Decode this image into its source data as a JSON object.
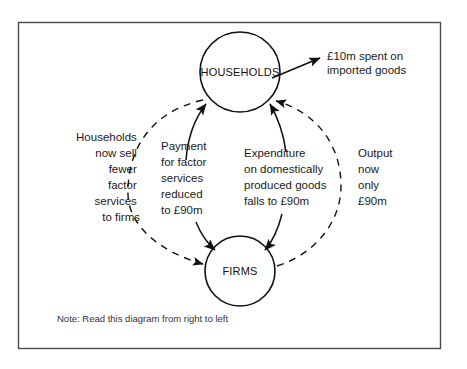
{
  "diagram": {
    "nodes": [
      {
        "id": "households",
        "label": "HOUSEHOLDS",
        "cx": 240,
        "cy": 72,
        "r": 40
      },
      {
        "id": "firms",
        "label": "FIRMS",
        "cx": 240,
        "cy": 271,
        "r": 35
      }
    ],
    "annotations": {
      "imports": "£10m spent on imported goods",
      "households_sell": "Households\nnow sell\nfewer\nfactor\nservices\nto firms",
      "households_sell_lines": [
        "Households",
        "now sell",
        "fewer",
        "factor",
        "services",
        "to firms"
      ],
      "payment": "Payment\nfor factor\nservices\nreduced\nto £90m",
      "payment_lines": [
        "Payment",
        "for factor",
        "services",
        "reduced",
        "to £90m"
      ],
      "expenditure": "Expenditure\non domestically\nproduced goods\nfalls to £90m",
      "expenditure_lines": [
        "Expenditure",
        "on domestically",
        "produced goods",
        "falls to £90m"
      ],
      "output": "Output\nnow\nonly\n£90m",
      "output_lines": [
        "Output",
        "now",
        "only",
        "£90m"
      ]
    },
    "note": "Note: Read this diagram from right to left",
    "colors": {
      "ink": "#111111",
      "frame": "#4a4a4a",
      "background": "#ffffff"
    }
  }
}
